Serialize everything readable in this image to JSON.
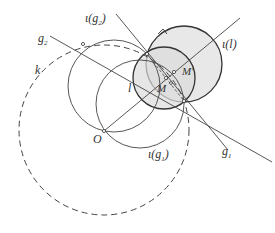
{
  "diagram": {
    "type": "geometric-construction",
    "colors": {
      "stroke": "#333333",
      "shade": "#e6e6e6",
      "background": "#ffffff"
    },
    "labels": {
      "g2": "g",
      "g2_sub": "2",
      "iota_g2": "ι(g",
      "iota_g2_sub": "2",
      "iota_g2_close": ")",
      "k": "k",
      "l": "l",
      "M": "M",
      "M_prime": "M'",
      "iota_l": "ι(l)",
      "O": "O",
      "iota_g1": "ι(g",
      "iota_g1_sub": "1",
      "iota_g1_close": ")",
      "g1": "g",
      "g1_sub": "1"
    }
  }
}
